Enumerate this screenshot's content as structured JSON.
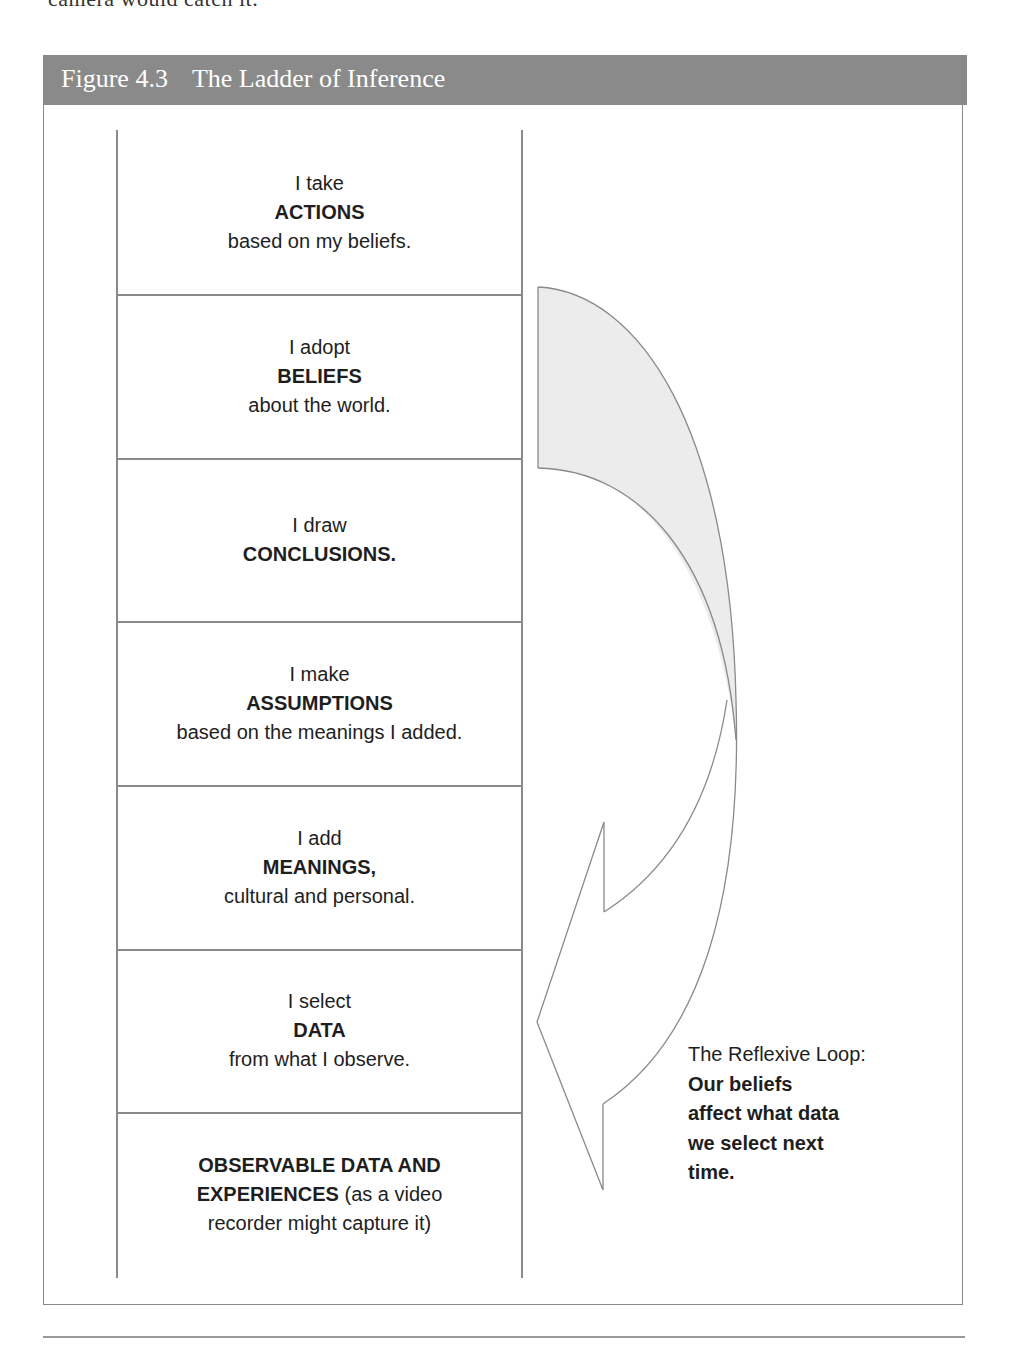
{
  "previous_text": "camera would catch it.",
  "figure": {
    "number": "Figure 4.3",
    "title": "The Ladder of Inference"
  },
  "ladder": {
    "rungs": [
      {
        "pre": "I take",
        "key": "ACTIONS",
        "post": "based on my beliefs."
      },
      {
        "pre": "I adopt",
        "key": "BELIEFS",
        "post": "about the world."
      },
      {
        "pre": "I draw",
        "key": "CONCLUSIONS.",
        "post": ""
      },
      {
        "pre": "I make",
        "key": "ASSUMPTIONS",
        "post": "based on the meanings I added."
      },
      {
        "pre": "I add",
        "key": "MEANINGS,",
        "post": "cultural and personal."
      },
      {
        "pre": "I select",
        "key": "DATA",
        "post": "from what I observe."
      }
    ],
    "base": {
      "line1_bold": "OBSERVABLE DATA AND",
      "line2_bold": "EXPERIENCES",
      "line2_rest": " (as a video",
      "line3": "recorder might capture it)"
    }
  },
  "reflexive_loop": {
    "heading": "The Reflexive Loop:",
    "lines": [
      "Our beliefs",
      "affect what data",
      "we select next",
      "time."
    ],
    "arrow_fill": "#ececec",
    "arrow_stroke": "#8a8a8a"
  },
  "colors": {
    "header_bg": "#8a8a8a",
    "header_text": "#ffffff",
    "lines": "#8a8a8a"
  }
}
